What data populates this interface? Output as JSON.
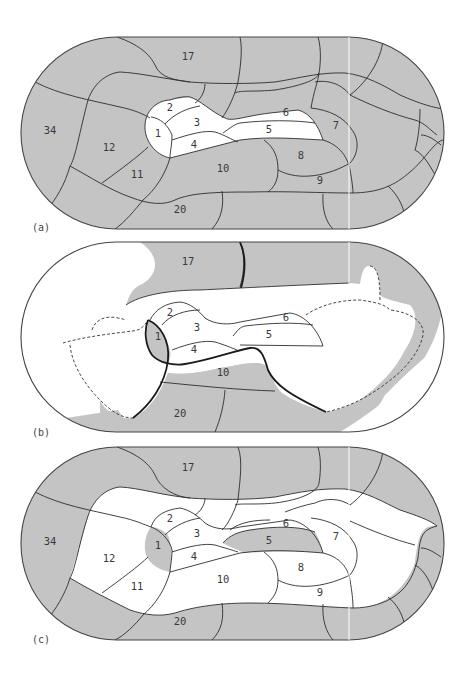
{
  "figure": {
    "panels": [
      {
        "id": "a",
        "caption": "(a)",
        "description": "Full cortical flat map, all areas shaded gray except areas 1-6",
        "region_labels": [
          {
            "id": "17",
            "text": "17"
          },
          {
            "id": "34",
            "text": "34"
          },
          {
            "id": "12",
            "text": "12"
          },
          {
            "id": "11",
            "text": "11"
          },
          {
            "id": "2",
            "text": "2"
          },
          {
            "id": "3",
            "text": "3"
          },
          {
            "id": "1",
            "text": "1"
          },
          {
            "id": "4",
            "text": "4"
          },
          {
            "id": "6",
            "text": "6"
          },
          {
            "id": "5",
            "text": "5"
          },
          {
            "id": "7",
            "text": "7"
          },
          {
            "id": "8",
            "text": "8"
          },
          {
            "id": "10",
            "text": "10"
          },
          {
            "id": "9",
            "text": "9"
          },
          {
            "id": "20",
            "text": "20"
          }
        ]
      },
      {
        "id": "b",
        "caption": "(b)",
        "description": "Map with dashed boundary region; areas 1, 10, 17, 20 shaded",
        "region_labels": [
          {
            "id": "17",
            "text": "17"
          },
          {
            "id": "2",
            "text": "2"
          },
          {
            "id": "3",
            "text": "3"
          },
          {
            "id": "1",
            "text": "1"
          },
          {
            "id": "4",
            "text": "4"
          },
          {
            "id": "6",
            "text": "6"
          },
          {
            "id": "5",
            "text": "5"
          },
          {
            "id": "10",
            "text": "10"
          },
          {
            "id": "20",
            "text": "20"
          }
        ]
      },
      {
        "id": "c",
        "caption": "(c)",
        "description": "Full map with outer ring shaded; areas 1 and 5 shaded, interior areas white",
        "region_labels": [
          {
            "id": "17",
            "text": "17"
          },
          {
            "id": "34",
            "text": "34"
          },
          {
            "id": "12",
            "text": "12"
          },
          {
            "id": "11",
            "text": "11"
          },
          {
            "id": "2",
            "text": "2"
          },
          {
            "id": "3",
            "text": "3"
          },
          {
            "id": "1",
            "text": "1"
          },
          {
            "id": "4",
            "text": "4"
          },
          {
            "id": "6",
            "text": "6"
          },
          {
            "id": "5",
            "text": "5"
          },
          {
            "id": "7",
            "text": "7"
          },
          {
            "id": "8",
            "text": "8"
          },
          {
            "id": "10",
            "text": "10"
          },
          {
            "id": "9",
            "text": "9"
          },
          {
            "id": "20",
            "text": "20"
          }
        ]
      }
    ],
    "colors": {
      "shaded": "#c4c4c4",
      "unshaded": "#ffffff",
      "boundary": "#2e2e2e"
    }
  }
}
